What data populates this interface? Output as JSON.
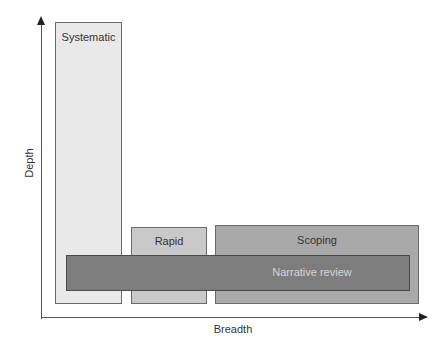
{
  "diagram": {
    "axes": {
      "y_label": "Depth",
      "x_label": "Breadth"
    },
    "boxes": [
      {
        "id": "systematic",
        "label": "Systematic",
        "fill": "#e9e9e9"
      },
      {
        "id": "rapid",
        "label": "Rapid",
        "fill": "#c9c9c9"
      },
      {
        "id": "scoping",
        "label": "Scoping",
        "fill": "#a9a9a9"
      },
      {
        "id": "narrative",
        "label": "Narrative review",
        "fill": "#7d7d7d"
      }
    ]
  }
}
